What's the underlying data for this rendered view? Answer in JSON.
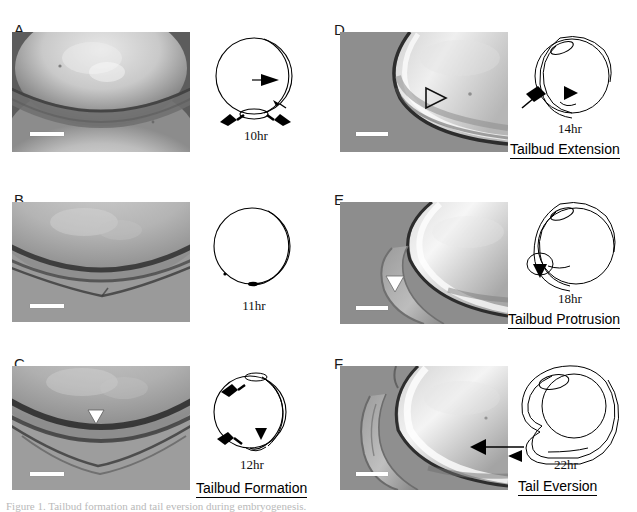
{
  "figure": {
    "background_color": "#ffffff",
    "panel_letters": [
      "A",
      "B",
      "C",
      "D",
      "E",
      "F"
    ],
    "caption_partial": "Figure 1. Tailbud formation and tail eversion during embryogenesis."
  },
  "panels": [
    {
      "letter": "A",
      "timestamp": "10hr",
      "stage_label": "",
      "arrowheads": [
        "black-right-arrow",
        "small-black-arrow"
      ],
      "arrows": [
        "down-left-arrow",
        "down-right-arrow"
      ],
      "marker": "none"
    },
    {
      "letter": "B",
      "timestamp": "11hr",
      "stage_label": "",
      "arrowheads": [
        "small-black-dot"
      ],
      "arrows": [],
      "marker": "none"
    },
    {
      "letter": "C",
      "timestamp": "12hr",
      "stage_label": "Tailbud Formation",
      "arrowheads": [
        "black-down-arrowhead"
      ],
      "arrows": [
        "upper-left-arrow",
        "lower-left-arrow"
      ],
      "marker": "white-arrowhead"
    },
    {
      "letter": "D",
      "timestamp": "14hr",
      "stage_label": "Tailbud Extension",
      "arrowheads": [
        "black-right-arrowhead"
      ],
      "arrows": [
        "upper-left-arrow"
      ],
      "marker": "open-arrowhead"
    },
    {
      "letter": "E",
      "timestamp": "18hr",
      "stage_label": "Tailbud Protrusion",
      "arrowheads": [
        "black-down-arrowhead"
      ],
      "arrows": [],
      "marker": "white-arrowhead"
    },
    {
      "letter": "F",
      "timestamp": "22hr",
      "stage_label": "Tail Eversion",
      "arrowheads": [],
      "arrows": [
        "left-arrow"
      ],
      "marker": "none"
    }
  ],
  "colors": {
    "ink": "#000000",
    "micrograph_mid": "#8a8a8a",
    "scalebar": "#ffffff",
    "letter_gray": "#1a1a1a"
  }
}
